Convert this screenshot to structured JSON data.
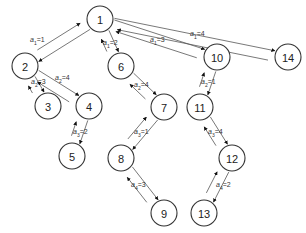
{
  "diagram": {
    "type": "tree",
    "nodes": [
      {
        "id": "1",
        "label": "1",
        "x": 100,
        "y": 19
      },
      {
        "id": "2",
        "label": "2",
        "x": 25,
        "y": 66
      },
      {
        "id": "3",
        "label": "3",
        "x": 48,
        "y": 106
      },
      {
        "id": "4",
        "label": "4",
        "x": 89,
        "y": 106
      },
      {
        "id": "5",
        "label": "5",
        "x": 72,
        "y": 156
      },
      {
        "id": "6",
        "label": "6",
        "x": 121,
        "y": 66
      },
      {
        "id": "7",
        "label": "7",
        "x": 164,
        "y": 107
      },
      {
        "id": "8",
        "label": "8",
        "x": 121,
        "y": 158
      },
      {
        "id": "9",
        "label": "9",
        "x": 164,
        "y": 213
      },
      {
        "id": "10",
        "label": "10",
        "x": 217,
        "y": 57
      },
      {
        "id": "11",
        "label": "11",
        "x": 200,
        "y": 107
      },
      {
        "id": "12",
        "label": "12",
        "x": 232,
        "y": 158
      },
      {
        "id": "13",
        "label": "13",
        "x": 204,
        "y": 213
      },
      {
        "id": "14",
        "label": "14",
        "x": 288,
        "y": 57
      }
    ],
    "edges": [
      {
        "from": "1",
        "to": "2",
        "label": "a1=1",
        "var": "a",
        "sub": "1",
        "value": "1",
        "lx": 30,
        "ly": 42
      },
      {
        "from": "1",
        "to": "6",
        "label": "a1=2",
        "var": "a",
        "sub": "1",
        "value": "2",
        "lx": 103,
        "ly": 45
      },
      {
        "from": "1",
        "to": "10",
        "label": "a1=3",
        "var": "a",
        "sub": "1",
        "value": "3",
        "lx": 150,
        "ly": 42
      },
      {
        "from": "1",
        "to": "14",
        "label": "a1=4",
        "var": "a",
        "sub": "1",
        "value": "4",
        "lx": 190,
        "ly": 36
      },
      {
        "from": "2",
        "to": "3",
        "label": "a2=3",
        "var": "a",
        "sub": "2",
        "value": "3",
        "lx": 31,
        "ly": 84
      },
      {
        "from": "2",
        "to": "4",
        "label": "a2=4",
        "var": "a",
        "sub": "2",
        "value": "4",
        "lx": 55,
        "ly": 80
      },
      {
        "from": "4",
        "to": "5",
        "label": "a3=2",
        "var": "a",
        "sub": "3",
        "value": "2",
        "lx": 73,
        "ly": 134
      },
      {
        "from": "6",
        "to": "7",
        "label": "a2=4",
        "var": "a",
        "sub": "2",
        "value": "4",
        "lx": 134,
        "ly": 87
      },
      {
        "from": "7",
        "to": "8",
        "label": "a3=1",
        "var": "a",
        "sub": "3",
        "value": "1",
        "lx": 134,
        "ly": 134
      },
      {
        "from": "8",
        "to": "9",
        "label": "a4=3",
        "var": "a",
        "sub": "4",
        "value": "3",
        "lx": 131,
        "ly": 187
      },
      {
        "from": "10",
        "to": "11",
        "label": "a2=1",
        "var": "a",
        "sub": "2",
        "value": "1",
        "lx": 201,
        "ly": 84
      },
      {
        "from": "11",
        "to": "12",
        "label": "a3=4",
        "var": "a",
        "sub": "3",
        "value": "4",
        "lx": 208,
        "ly": 134
      },
      {
        "from": "12",
        "to": "13",
        "label": "a4=2",
        "var": "a",
        "sub": "4",
        "value": "2",
        "lx": 216,
        "ly": 187
      }
    ]
  }
}
